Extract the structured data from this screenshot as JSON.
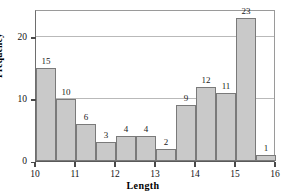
{
  "chart_data": {
    "type": "bar",
    "title": "",
    "subtitle": "",
    "xlabel": "Length",
    "ylabel": "Frequency",
    "xlim": [
      10,
      16
    ],
    "ylim": [
      0,
      24.5
    ],
    "bin_width": 0.5,
    "grid": true,
    "gridlines_y": [
      10,
      20
    ],
    "legend": null,
    "legend_position": "none",
    "x_ticks": [
      10,
      11,
      12,
      13,
      14,
      15,
      16
    ],
    "x_tick_labels": [
      "10",
      "11",
      "12",
      "13",
      "14",
      "15",
      "16"
    ],
    "y_ticks": [
      0,
      10,
      20
    ],
    "y_tick_labels": [
      "0",
      "10",
      "20"
    ],
    "bin_edges": [
      10,
      10.5,
      11,
      11.5,
      12,
      12.5,
      13,
      13.5,
      14,
      14.5,
      15,
      15.5,
      16
    ],
    "categories": [
      "10.0-10.5",
      "10.5-11.0",
      "11.0-11.5",
      "11.5-12.0",
      "12.0-12.5",
      "12.5-13.0",
      "13.0-13.5",
      "13.5-14.0",
      "14.0-14.5",
      "14.5-15.0",
      "15.0-15.5",
      "15.5-16.0"
    ],
    "values": [
      15,
      10,
      6,
      3,
      4,
      4,
      2,
      9,
      12,
      11,
      23,
      1
    ],
    "data_labels": [
      "15",
      "10",
      "6",
      "3",
      "4",
      "4",
      "2",
      "9",
      "12",
      "11",
      "23",
      "1"
    ],
    "bar_fill_color": "#c9c9c9",
    "bar_border_color": "#7a7a7a",
    "grid_color": "#b9b9b9",
    "axis_color": "#4a4a4a"
  },
  "axes": {
    "y_title": "Frequency",
    "x_title": "Length"
  }
}
